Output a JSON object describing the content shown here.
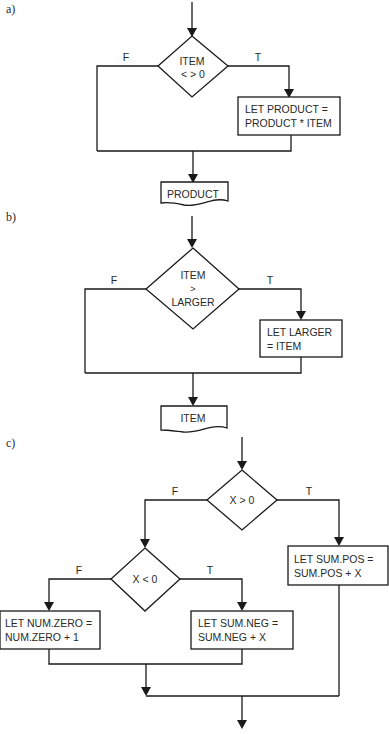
{
  "parts": [
    {
      "label": "a)",
      "decision": {
        "line1": "ITEM",
        "line2": "< > 0"
      },
      "false_label": "F",
      "true_label": "T",
      "process": {
        "line1": "LET PRODUCT =",
        "line2": "PRODUCT * ITEM"
      },
      "output": "PRODUCT"
    },
    {
      "label": "b)",
      "decision": {
        "line1": "ITEM",
        "line2": ">",
        "line3": "LARGER"
      },
      "false_label": "F",
      "true_label": "T",
      "process": {
        "line1": "LET LARGER",
        "line2": "= ITEM"
      },
      "output": "ITEM"
    },
    {
      "label": "c)",
      "decision_outer": {
        "text": "X > 0"
      },
      "outer_false_label": "F",
      "outer_true_label": "T",
      "process_pos": {
        "line1": "LET SUM.POS =",
        "line2": "SUM.POS + X"
      },
      "decision_inner": {
        "text": "X < 0"
      },
      "inner_false_label": "F",
      "inner_true_label": "T",
      "process_zero": {
        "line1": "LET NUM.ZERO =",
        "line2": "NUM.ZERO + 1"
      },
      "process_neg": {
        "line1": "LET SUM.NEG =",
        "line2": "SUM.NEG + X"
      }
    }
  ]
}
